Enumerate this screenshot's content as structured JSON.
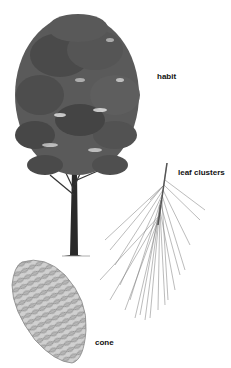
{
  "figure": {
    "labels": {
      "habit": "habit",
      "leaf_clusters": "leaf clusters",
      "cone": "cone"
    },
    "colors": {
      "background": "#ffffff",
      "foliage_dark": "#3c3c3c",
      "foliage_mid": "#5a5a5a",
      "foliage_light": "#7a7a7a",
      "trunk": "#2a2a2a",
      "needles": "#6a6a6a",
      "cone_fill": "#c8c8c8",
      "cone_scale": "#8a8a8a",
      "label": "#111111"
    }
  }
}
